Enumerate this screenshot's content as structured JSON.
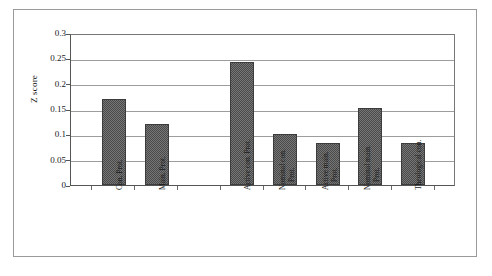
{
  "chart_data": {
    "type": "bar",
    "title": "",
    "subtitle": "",
    "xlabel": "",
    "ylabel": "Z score",
    "ylim": [
      0,
      0.3
    ],
    "ytick_labels": [
      "0.3",
      "0.25",
      "0.2",
      "0.15",
      "0.1",
      "0.05",
      "0"
    ],
    "ytick_values": [
      0.3,
      0.25,
      0.2,
      0.15,
      0.1,
      0.05,
      0
    ],
    "grid": "horizontal",
    "legend": "none",
    "categories": [
      "Con. Prot.",
      "Main. Prot.",
      "Active con. Prot.",
      "Nominal con. Prot.",
      "Active main. Prot.",
      "Nominal main. Prot.",
      "Theological con."
    ],
    "values": [
      0.17,
      0.121,
      0.242,
      0.101,
      0.082,
      0.152,
      0.083
    ],
    "bar_color": "#767676",
    "bar_edge_color": "#3c3c3c",
    "gridline_color": "#9d9d9d",
    "axis_color": "#555555",
    "gap_after_category_index": 1,
    "bars": [
      {
        "label": "Con. Prot.",
        "label_line1": "Con. Prot.",
        "label_line2": "",
        "value": 0.17
      },
      {
        "label": "Main. Prot.",
        "label_line1": "Main. Prot.",
        "label_line2": "",
        "value": 0.121
      },
      {
        "label": "Active con. Prot.",
        "label_line1": "Active con. Prot.",
        "label_line2": "",
        "value": 0.242
      },
      {
        "label": "Nominal con. Prot.",
        "label_line1": "Nominal con.",
        "label_line2": "Prot.",
        "value": 0.101
      },
      {
        "label": "Active main. Prot.",
        "label_line1": "Active main.",
        "label_line2": "Prot.",
        "value": 0.082
      },
      {
        "label": "Nominal main. Prot.",
        "label_line1": "Nominal main.",
        "label_line2": "Prot.",
        "value": 0.152
      },
      {
        "label": "Theological con.",
        "label_line1": "Theological con.",
        "label_line2": "",
        "value": 0.083
      }
    ]
  }
}
